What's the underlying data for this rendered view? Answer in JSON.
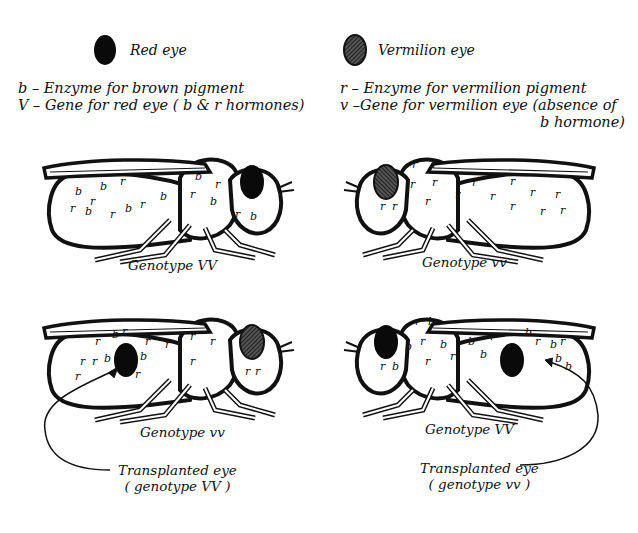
{
  "legend": {
    "red": {
      "label": "Red eye",
      "icon": "solid-black-oval",
      "color": "#0a0a0a"
    },
    "vermilion": {
      "label": "Vermilion eye",
      "icon": "hatched-oval",
      "color": "#3a3a3a"
    }
  },
  "definitions": {
    "left": [
      "b –  Enzyme for brown pigment",
      "V – Gene for red eye ( b & r hormones)"
    ],
    "right": [
      "r – Enzyme for vermilion pigment",
      "v –Gene for vermilion eye (absence of",
      "b hormone)"
    ]
  },
  "flies": [
    {
      "id": "top-left",
      "caption": "Genotype VV",
      "facing": "right",
      "eye": "red",
      "body_marks": [
        "b",
        "b",
        "r",
        "b",
        "r",
        "b",
        "r",
        "b",
        "r",
        "b",
        "r",
        "b",
        "r",
        "b",
        "r",
        "b"
      ],
      "transplant": null
    },
    {
      "id": "top-right",
      "caption": "Genotype vv",
      "facing": "left",
      "eye": "vermilion",
      "body_marks": [
        "r",
        "r",
        "r",
        "r",
        "r",
        "r",
        "r",
        "r",
        "r",
        "r",
        "r",
        "r",
        "r",
        "r",
        "r",
        "r"
      ],
      "transplant": null
    },
    {
      "id": "bottom-left",
      "caption": "Genotype vv",
      "facing": "right",
      "eye": "vermilion",
      "body_marks": [
        "r",
        "b",
        "r",
        "r",
        "b",
        "r",
        "r",
        "b",
        "r",
        "r",
        "r",
        "r",
        "r",
        "r",
        "r",
        "r"
      ],
      "transplant": {
        "label_line1": "Transplanted eye",
        "label_line2": "( genotype VV )",
        "eye": "red"
      }
    },
    {
      "id": "bottom-right",
      "caption": "Genotype VV",
      "facing": "left",
      "eye": "red",
      "body_marks": [
        "r",
        "b",
        "b",
        "r",
        "b",
        "b",
        "r",
        "b",
        "r",
        "b",
        "b",
        "r",
        "b",
        "r",
        "b",
        "b"
      ],
      "transplant": {
        "label_line1": "Transplanted eye",
        "label_line2": "( genotype vv )",
        "eye": "vermilion"
      }
    }
  ]
}
